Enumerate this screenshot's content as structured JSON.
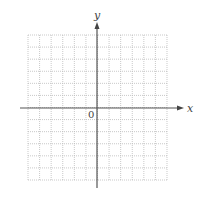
{
  "diagram": {
    "type": "coordinate-grid",
    "x_axis_label": "x",
    "y_axis_label": "y",
    "origin_label": "0",
    "grid": {
      "columns": 12,
      "rows": 12,
      "line_style": "dotted"
    },
    "colors": {
      "axis": "#555555",
      "grid": "#bbbbbb",
      "label": "#444444"
    }
  }
}
